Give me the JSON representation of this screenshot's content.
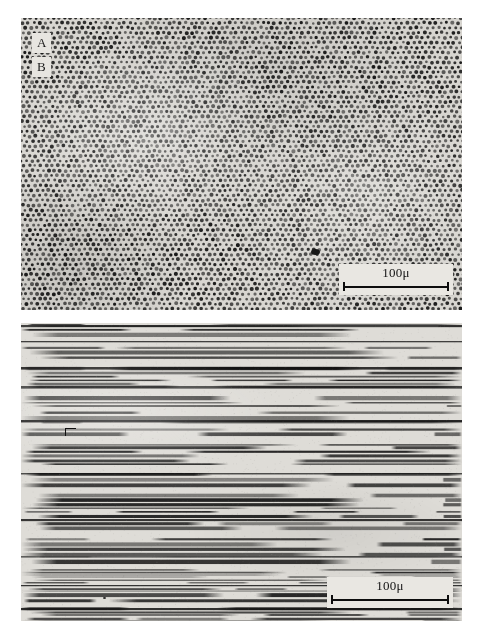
{
  "figure": {
    "kind": "two-panel-micrograph",
    "background_color": "#ffffff",
    "width": 478,
    "height": 633
  },
  "panels": [
    {
      "id": "A",
      "label": "A",
      "name": "panel-a",
      "view": "transverse-section",
      "texture": "hexagonal-dot-array",
      "bounds": {
        "x": 21,
        "y": 18,
        "width": 441,
        "height": 292
      },
      "background_color": "#d8d6d1",
      "dot_color": "#1c1c1c",
      "dot_diameter_px": 3.2,
      "dot_spacing_px": 5.6,
      "lattice_rows": 54,
      "lattice_cols": 82,
      "scalebar": {
        "label": "100μ",
        "value": 100,
        "unit": "μ",
        "bar_length_px": 98,
        "bounds": {
          "x": 339,
          "y": 264,
          "width": 106,
          "height": 32
        }
      },
      "artifacts": [
        {
          "type": "dark-blob",
          "x": 311,
          "y": 249,
          "width": 9,
          "height": 6
        },
        {
          "type": "speck",
          "x": 128,
          "y": 297,
          "width": 2,
          "height": 4
        }
      ]
    },
    {
      "id": "B",
      "label": "B",
      "name": "panel-b",
      "view": "longitudinal-section",
      "texture": "horizontal-striations",
      "bounds": {
        "x": 21,
        "y": 323,
        "width": 441,
        "height": 298
      },
      "background_color": "#dedcd7",
      "stripe_color": "#141414",
      "stripe_count": 96,
      "scalebar": {
        "label": "100μ",
        "value": 100,
        "unit": "μ",
        "bar_length_px": 110,
        "bounds": {
          "x": 327,
          "y": 577,
          "width": 118,
          "height": 32
        }
      },
      "artifacts": [
        {
          "type": "hook-bracket",
          "x": 65,
          "y": 428,
          "width": 10,
          "height": 7
        },
        {
          "type": "speck",
          "x": 103,
          "y": 597,
          "width": 3,
          "height": 2
        }
      ]
    }
  ],
  "chart_data": {
    "type": "heatmap",
    "title": "",
    "xlabel": "",
    "ylabel": "",
    "panels": [
      {
        "id": "A",
        "description": "Transverse section: dense quasi-hexagonal array of dark circular profiles on light matrix",
        "scale_label": "100μ",
        "scale_value": 100,
        "scale_unit": "μ",
        "scale_bar_px": 98,
        "px_per_micron": 0.98,
        "feature_diameter_px": 3.2,
        "feature_spacing_px": 5.6,
        "feature_diameter_micron": 3.3,
        "feature_spacing_micron": 5.7,
        "estimated_feature_count": 4400
      },
      {
        "id": "B",
        "description": "Longitudinal section: overlapping horizontal dark fiber profiles of varying length and thickness",
        "scale_label": "100μ",
        "scale_value": 100,
        "scale_unit": "μ",
        "scale_bar_px": 110,
        "px_per_micron": 1.1,
        "stripe_count": 96,
        "stripe_thickness_px_range": [
          1,
          5
        ],
        "stripe_thickness_micron_range": [
          0.9,
          4.5
        ]
      }
    ]
  }
}
